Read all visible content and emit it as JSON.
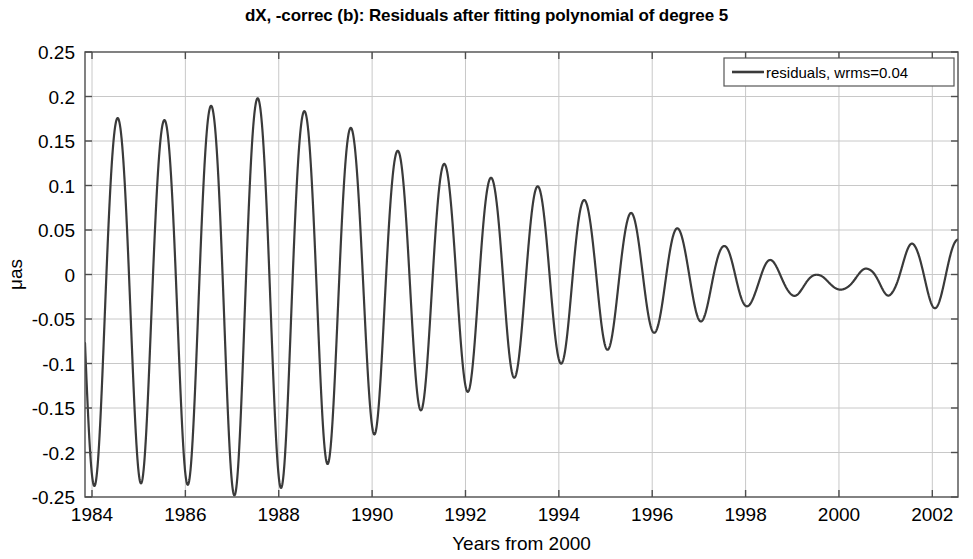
{
  "chart_data": {
    "type": "line",
    "title": "dX, -correc (b): Residuals after fitting polynomial of degree 5",
    "xlabel": "Years from 2000",
    "ylabel": "μas",
    "xlim": [
      1983.85,
      2002.55
    ],
    "ylim": [
      -0.25,
      0.25
    ],
    "grid": true,
    "xticks": [
      1984,
      1986,
      1988,
      1990,
      1992,
      1994,
      1996,
      1998,
      2000,
      2002
    ],
    "xticklabels": [
      "1984",
      "1986",
      "1988",
      "1990",
      "1992",
      "1994",
      "1996",
      "1998",
      "2000",
      "2002"
    ],
    "yticks": [
      -0.25,
      -0.2,
      -0.15,
      -0.1,
      -0.05,
      0,
      0.05,
      0.1,
      0.15,
      0.2,
      0.25
    ],
    "yticklabels": [
      "-0.25",
      "-0.2",
      "-0.15",
      "-0.1",
      "-0.05",
      "0",
      "0.05",
      "0.1",
      "0.15",
      "0.2",
      "0.25"
    ],
    "legend": {
      "position": "upper right",
      "entries": [
        {
          "label": "residuals, wrms=0.04",
          "color": "#3a3a3a"
        }
      ]
    },
    "series": [
      {
        "name": "residuals, wrms=0.04",
        "color": "#3a3a3a",
        "linewidth": 2.2,
        "wrms": 0.04,
        "description": "Annual-period oscillation, amplitude decaying from ~0.22 uas in 1984-1987 to near zero around 1999-2000, then growing again to ~0.045 uas by 2002.",
        "period_years": 1.0,
        "envelope_knots": [
          {
            "x": 1983.9,
            "amp": 0.215
          },
          {
            "x": 1984.4,
            "amp": 0.218
          },
          {
            "x": 1985.0,
            "amp": 0.215
          },
          {
            "x": 1985.5,
            "amp": 0.212
          },
          {
            "x": 1986.0,
            "amp": 0.218
          },
          {
            "x": 1986.5,
            "amp": 0.228
          },
          {
            "x": 1987.3,
            "amp": 0.235
          },
          {
            "x": 1988.0,
            "amp": 0.228
          },
          {
            "x": 1988.6,
            "amp": 0.215
          },
          {
            "x": 1989.3,
            "amp": 0.198
          },
          {
            "x": 1990.0,
            "amp": 0.172
          },
          {
            "x": 1990.6,
            "amp": 0.158
          },
          {
            "x": 1991.3,
            "amp": 0.142
          },
          {
            "x": 1992.0,
            "amp": 0.128
          },
          {
            "x": 1992.7,
            "amp": 0.118
          },
          {
            "x": 1993.4,
            "amp": 0.108
          },
          {
            "x": 1994.1,
            "amp": 0.098
          },
          {
            "x": 1994.8,
            "amp": 0.086
          },
          {
            "x": 1995.5,
            "amp": 0.074
          },
          {
            "x": 1996.2,
            "amp": 0.062
          },
          {
            "x": 1996.9,
            "amp": 0.05
          },
          {
            "x": 1997.6,
            "amp": 0.038
          },
          {
            "x": 1998.3,
            "amp": 0.026
          },
          {
            "x": 1999.0,
            "amp": 0.016
          },
          {
            "x": 1999.6,
            "amp": 0.009
          },
          {
            "x": 2000.1,
            "amp": 0.007
          },
          {
            "x": 2000.6,
            "amp": 0.012
          },
          {
            "x": 2001.1,
            "amp": 0.022
          },
          {
            "x": 2001.6,
            "amp": 0.034
          },
          {
            "x": 2002.1,
            "amp": 0.042
          },
          {
            "x": 2002.55,
            "amp": 0.04
          }
        ],
        "offset_knots": [
          {
            "x": 1983.9,
            "off": -0.022
          },
          {
            "x": 1986.0,
            "off": -0.018
          },
          {
            "x": 1988.0,
            "off": -0.012
          },
          {
            "x": 1990.0,
            "off": -0.008
          },
          {
            "x": 1992.0,
            "off": -0.004
          },
          {
            "x": 1994.0,
            "off": -0.002
          },
          {
            "x": 1996.0,
            "off": -0.002
          },
          {
            "x": 1998.0,
            "off": -0.006
          },
          {
            "x": 2000.0,
            "off": -0.01
          },
          {
            "x": 2001.0,
            "off": -0.002
          },
          {
            "x": 2002.0,
            "off": 0.004
          },
          {
            "x": 2002.55,
            "off": 0.0
          }
        ],
        "phase_offset_years": 0.3,
        "peak_values": [
          0.195,
          0.183,
          0.185,
          0.201,
          0.216,
          0.225,
          0.229,
          0.224,
          0.212,
          0.196,
          0.175,
          0.16,
          0.139,
          0.122,
          0.113,
          0.104,
          0.093,
          0.082,
          0.069,
          0.057,
          0.046,
          0.035,
          0.024,
          0.013,
          0.006,
          0.008,
          0.017,
          0.03,
          0.043,
          0.046
        ],
        "trough_values": [
          -0.227,
          -0.24,
          -0.244,
          -0.232,
          -0.218,
          -0.207,
          -0.2,
          -0.193,
          -0.184,
          -0.172,
          -0.159,
          -0.146,
          -0.133,
          -0.122,
          -0.112,
          -0.102,
          -0.092,
          -0.082,
          -0.072,
          -0.062,
          -0.052,
          -0.043,
          -0.034,
          -0.026,
          -0.02,
          -0.016,
          -0.018,
          -0.025,
          -0.035,
          -0.038
        ],
        "start_value": -0.075,
        "end_value": -0.035
      }
    ]
  }
}
